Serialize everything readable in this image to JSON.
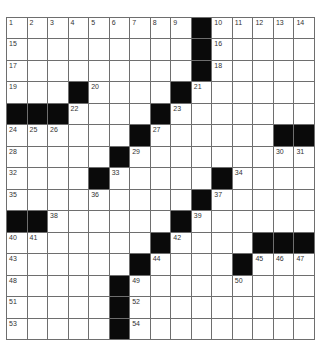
{
  "puzzle": {
    "rows": 15,
    "cols": 15,
    "colors": {
      "black": "#0a0a0a",
      "white": "#ffffff",
      "line": "#6e6e6e",
      "number": "#333333"
    },
    "grid": [
      [
        "1",
        "2",
        "3",
        "4",
        "5",
        "6",
        "7",
        "8",
        "9",
        "#",
        "10",
        "11",
        "12",
        "13",
        "14"
      ],
      [
        "15",
        ".",
        ".",
        ".",
        ".",
        ".",
        ".",
        ".",
        ".",
        "#",
        "16",
        ".",
        ".",
        ".",
        "."
      ],
      [
        "17",
        ".",
        ".",
        ".",
        ".",
        ".",
        ".",
        ".",
        ".",
        "#",
        "18",
        ".",
        ".",
        ".",
        "."
      ],
      [
        "19",
        ".",
        ".",
        "#",
        "20",
        ".",
        ".",
        ".",
        "#",
        "21",
        ".",
        ".",
        ".",
        ".",
        "."
      ],
      [
        "#",
        "#",
        "#",
        "22",
        ".",
        ".",
        ".",
        "#",
        "23",
        ".",
        ".",
        ".",
        ".",
        ".",
        "."
      ],
      [
        "24",
        "25",
        "26",
        ".",
        ".",
        ".",
        "#",
        "27",
        ".",
        ".",
        ".",
        ".",
        ".",
        "#",
        "#"
      ],
      [
        "28",
        ".",
        ".",
        ".",
        ".",
        "#",
        "29",
        ".",
        ".",
        ".",
        ".",
        ".",
        ".",
        "30",
        "31"
      ],
      [
        "32",
        ".",
        ".",
        ".",
        "#",
        "33",
        ".",
        ".",
        ".",
        ".",
        "#",
        "34",
        ".",
        ".",
        "."
      ],
      [
        "35",
        ".",
        ".",
        ".",
        "36",
        ".",
        ".",
        ".",
        ".",
        "#",
        "37",
        ".",
        ".",
        ".",
        "."
      ],
      [
        "#",
        "#",
        "38",
        ".",
        ".",
        ".",
        ".",
        ".",
        "#",
        "39",
        ".",
        ".",
        ".",
        ".",
        "."
      ],
      [
        "40",
        "41",
        ".",
        ".",
        ".",
        ".",
        ".",
        "#",
        "42",
        ".",
        ".",
        ".",
        "#",
        "#",
        "#"
      ],
      [
        "43",
        ".",
        ".",
        ".",
        ".",
        ".",
        "#",
        "44",
        ".",
        ".",
        ".",
        "#",
        "45",
        "46",
        "47"
      ],
      [
        "48",
        ".",
        ".",
        ".",
        ".",
        "#",
        "49",
        ".",
        ".",
        ".",
        ".",
        "50",
        ".",
        ".",
        "."
      ],
      [
        "51",
        ".",
        ".",
        ".",
        ".",
        "#",
        "52",
        ".",
        ".",
        ".",
        ".",
        ".",
        ".",
        ".",
        "."
      ],
      [
        "53",
        ".",
        ".",
        ".",
        ".",
        "#",
        "54",
        ".",
        ".",
        ".",
        ".",
        ".",
        ".",
        ".",
        "."
      ]
    ]
  }
}
